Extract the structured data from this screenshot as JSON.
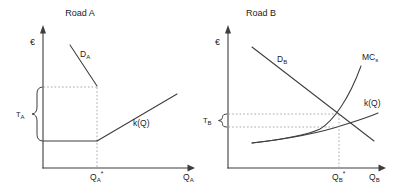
{
  "figure": {
    "colors": {
      "background": "#ffffff",
      "line": "#3d3d3d",
      "dotted_guide": "#929292",
      "text": "#1c1c1c"
    },
    "road_a": {
      "title": "Road A",
      "y_axis_symbol": "€",
      "demand": {
        "main": "D",
        "sub": "A"
      },
      "toll": {
        "main": "T",
        "sub": "A"
      },
      "cost_label": "k(Q)",
      "q_star": {
        "main": "Q",
        "sub": "A",
        "sup": "*"
      },
      "q_axis": {
        "main": "Q",
        "sub": "A"
      }
    },
    "road_b": {
      "title": "Road B",
      "y_axis_symbol": "€",
      "demand": {
        "main": "D",
        "sub": "B"
      },
      "marginal_cost": {
        "main": "MC",
        "sub": "s"
      },
      "toll": {
        "main": "T",
        "sub": "B"
      },
      "cost_label": "k(Q)",
      "q_star": {
        "main": "Q",
        "sub": "B",
        "sup": "*"
      },
      "q_axis": {
        "main": "Q",
        "sub": "B"
      }
    }
  }
}
